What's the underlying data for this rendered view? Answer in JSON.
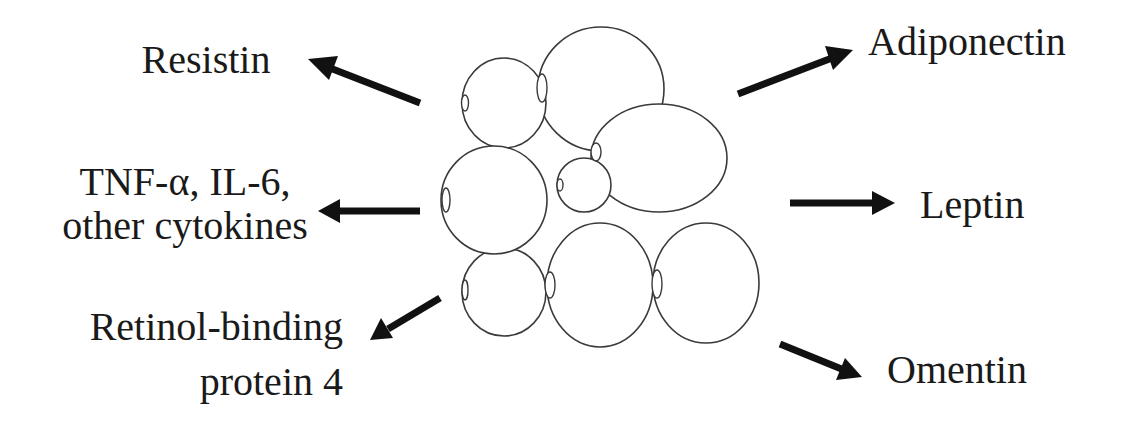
{
  "diagram": {
    "center": {
      "name": "adipocyte-cluster",
      "cells": [
        {
          "id": "cell-a",
          "cx": 504,
          "cy": 103,
          "rx": 42,
          "ry": 45,
          "nucleus": {
            "cx": 465,
            "cy": 103,
            "rx": 3.5,
            "ry": 8
          }
        },
        {
          "id": "cell-b",
          "cx": 601,
          "cy": 89,
          "rx": 63,
          "ry": 62,
          "nucleus": {
            "cx": 542,
            "cy": 88,
            "rx": 5,
            "ry": 14
          }
        },
        {
          "id": "cell-c",
          "cx": 659,
          "cy": 158,
          "rx": 68,
          "ry": 54,
          "nucleus": {
            "cx": 596,
            "cy": 152,
            "rx": 5,
            "ry": 9
          }
        },
        {
          "id": "cell-d",
          "cx": 584,
          "cy": 185,
          "rx": 27,
          "ry": 27,
          "nucleus": {
            "cx": 560,
            "cy": 185,
            "rx": 3,
            "ry": 6
          }
        },
        {
          "id": "cell-e",
          "cx": 494,
          "cy": 200,
          "rx": 53,
          "ry": 54,
          "nucleus": {
            "cx": 446,
            "cy": 200,
            "rx": 4,
            "ry": 12
          }
        },
        {
          "id": "cell-f",
          "cx": 504,
          "cy": 292,
          "rx": 42,
          "ry": 44,
          "nucleus": {
            "cx": 465,
            "cy": 290,
            "rx": 3,
            "ry": 10
          }
        },
        {
          "id": "cell-g",
          "cx": 600,
          "cy": 285,
          "rx": 53,
          "ry": 62,
          "nucleus": {
            "cx": 550,
            "cy": 285,
            "rx": 5,
            "ry": 13
          }
        },
        {
          "id": "cell-h",
          "cx": 706,
          "cy": 283,
          "rx": 53,
          "ry": 60,
          "nucleus": {
            "cx": 657,
            "cy": 284,
            "rx": 5,
            "ry": 14
          }
        }
      ]
    },
    "outputs": {
      "resistin": {
        "lines": [
          "Resistin"
        ],
        "arrow": {
          "from": [
            420,
            103
          ],
          "to": [
            308,
            59
          ]
        }
      },
      "cytokines": {
        "lines": [
          "TNF-α, IL-6,",
          "other cytokines"
        ],
        "arrow": {
          "from": [
            420,
            211
          ],
          "to": [
            318,
            211
          ]
        }
      },
      "rbp4": {
        "lines": [
          "Retinol-binding",
          "protein 4"
        ],
        "arrow": {
          "from": [
            440,
            298
          ],
          "to": [
            370,
            340
          ]
        }
      },
      "adiponectin": {
        "lines": [
          "Adiponectin"
        ],
        "arrow": {
          "from": [
            738,
            94
          ],
          "to": [
            853,
            50
          ]
        }
      },
      "leptin": {
        "lines": [
          "Leptin"
        ],
        "arrow": {
          "from": [
            790,
            203
          ],
          "to": [
            895,
            203
          ]
        }
      },
      "omentin": {
        "lines": [
          "Omentin"
        ],
        "arrow": {
          "from": [
            780,
            344
          ],
          "to": [
            862,
            377
          ]
        }
      }
    },
    "colors": {
      "background": "#ffffff",
      "ink": "#111111",
      "outline": "#3a3a3a"
    }
  }
}
